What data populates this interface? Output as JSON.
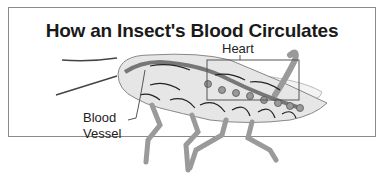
{
  "diagram": {
    "title": "How an Insect's Blood Circulates",
    "labels": {
      "heart": "Heart",
      "blood_vessel_line1": "Blood",
      "blood_vessel_line2": "Vessel"
    },
    "colors": {
      "body_fill": "#e6e6e6",
      "vessel": "#777777",
      "legs": "#9a9a9a",
      "arrows": "#222222",
      "frame": "#8a8a8a"
    }
  }
}
